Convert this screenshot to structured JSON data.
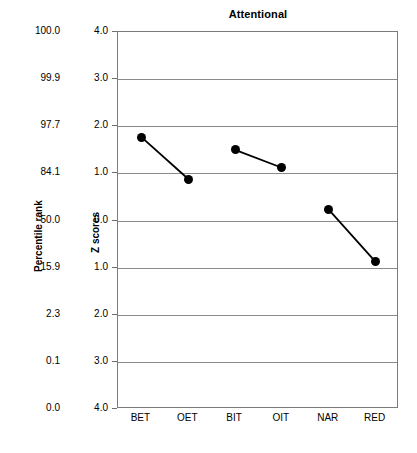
{
  "chart_data": {
    "type": "line",
    "title": "Attentional",
    "xlabel": "",
    "ylabel": "Z scores",
    "secondary_ylabel": "Percentile rank",
    "grid": true,
    "legend": "none",
    "categories": [
      "BET",
      "OET",
      "BIT",
      "OIT",
      "NAR",
      "RED"
    ],
    "ylim": [
      -4.0,
      4.0
    ],
    "ytick_values": [
      4.0,
      3.0,
      2.0,
      1.0,
      0.0,
      -1.0,
      -2.0,
      -3.0,
      -4.0
    ],
    "ytick_labels": [
      "4.0",
      "3.0",
      "2.0",
      "1.0",
      "0.0",
      "1.0",
      "2.0",
      "3.0",
      "4.0"
    ],
    "secondary_ytick_labels": [
      "100.0",
      "99.9",
      "97.7",
      "84.1",
      "50.0",
      "15.9",
      "2.3",
      "0.1",
      "0.0"
    ],
    "series": [
      {
        "name": "BET-OET",
        "points": [
          {
            "category": "BET",
            "value": 1.77
          },
          {
            "category": "OET",
            "value": 0.88
          }
        ]
      },
      {
        "name": "BIT-OIT",
        "points": [
          {
            "category": "BIT",
            "value": 1.5
          },
          {
            "category": "OIT",
            "value": 1.12
          }
        ]
      },
      {
        "name": "NAR-RED",
        "points": [
          {
            "category": "NAR",
            "value": 0.23
          },
          {
            "category": "RED",
            "value": -0.88
          }
        ]
      }
    ],
    "colors": {
      "marker": "#000000",
      "line": "#000000",
      "grid": "#8a8a8a",
      "frame": "#7b7b7b",
      "background": "#ffffff"
    }
  }
}
